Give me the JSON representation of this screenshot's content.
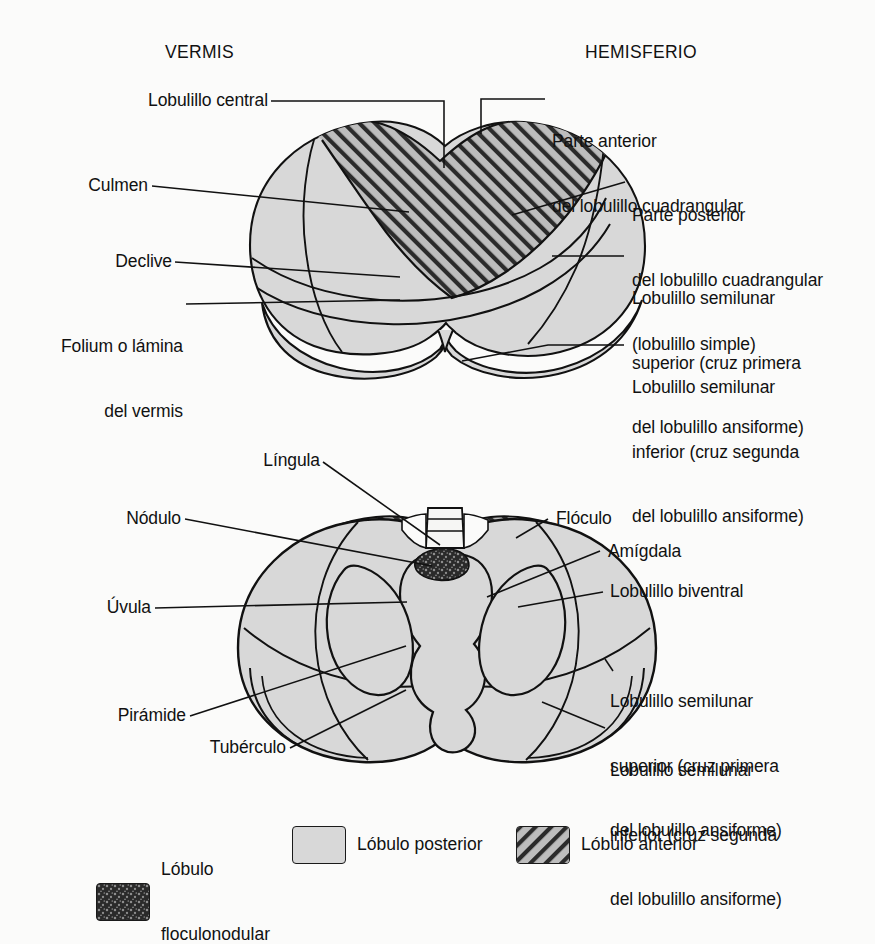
{
  "figure": {
    "headers": [
      {
        "id": "vermis",
        "text": "VERMIS"
      },
      {
        "id": "hemisferio",
        "text": "HEMISFERIO"
      }
    ],
    "upper_view": {
      "labels_left": [
        {
          "id": "lobulillo-central",
          "text": "Lobulillo central"
        },
        {
          "id": "culmen",
          "text": "Culmen"
        },
        {
          "id": "declive",
          "text": "Declive"
        },
        {
          "id": "folium",
          "line1": "Folium o lámina",
          "line2": "del vermis"
        }
      ],
      "labels_right": [
        {
          "id": "parte-anterior-cuadrangular",
          "line1": "Parte anterior",
          "line2": "del lobulillo cuadrangular"
        },
        {
          "id": "parte-posterior-cuadrangular",
          "line1": "Parte posterior",
          "line2": "del lobulillo cuadrangular",
          "line3": "(lobulillo simple)"
        },
        {
          "id": "semilunar-superior",
          "line1": "Lobulillo semilunar",
          "line2": "superior (cruz primera",
          "line3": "del lobulillo ansiforme)"
        },
        {
          "id": "semilunar-inferior",
          "line1": "Lobulillo semilunar",
          "line2": "inferior (cruz segunda",
          "line3": "del lobulillo ansiforme)"
        }
      ]
    },
    "lower_view": {
      "labels_left": [
        {
          "id": "lingula",
          "text": "Língula"
        },
        {
          "id": "nodulo",
          "text": "Nódulo"
        },
        {
          "id": "uvula",
          "text": "Úvula"
        },
        {
          "id": "piramide",
          "text": "Pirámide"
        },
        {
          "id": "tuberculo",
          "text": "Tubérculo"
        }
      ],
      "labels_right": [
        {
          "id": "floculo",
          "text": "Flóculo"
        },
        {
          "id": "amigdala",
          "text": "Amígdala"
        },
        {
          "id": "lobulillo-biventral",
          "text": "Lobulillo biventral"
        },
        {
          "id": "semilunar-superior-inf",
          "line1": "Lobulillo semilunar",
          "line2": "superior (cruz primera",
          "line3": "del lobulillo ansiforme)"
        },
        {
          "id": "semilunar-inferior-inf",
          "line1": "Lobulillo semilunar",
          "line2": "inferior (cruz segunda",
          "line3": "del lobulillo ansiforme)"
        }
      ]
    },
    "legend": [
      {
        "id": "lobulo-floculonodular",
        "swatch": "floculonodular-swatch",
        "line1": "Lóbulo",
        "line2": "floculonodular"
      },
      {
        "id": "lobulo-posterior",
        "swatch": "posterior-swatch",
        "line1": "Lóbulo posterior",
        "line2": ""
      },
      {
        "id": "lobulo-anterior",
        "swatch": "anterior-swatch",
        "line1": "Lóbulo anterior",
        "line2": ""
      }
    ],
    "colors": {
      "posterior_fill": "#d8d8d8",
      "anterior_fill": "#b8b8b8",
      "floculonodular_fill": "#2e2e2e",
      "outline": "#111111",
      "background": "#fbfbfa"
    }
  }
}
